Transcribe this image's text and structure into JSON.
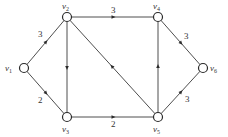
{
  "graph": {
    "type": "directed-weighted",
    "nodes": [
      {
        "id": "v1",
        "label": "v",
        "sub": "1",
        "x": 24,
        "y": 68,
        "lx": 5,
        "ly": 71
      },
      {
        "id": "v2",
        "label": "v",
        "sub": "2",
        "x": 67,
        "y": 17,
        "lx": 62,
        "ly": 9
      },
      {
        "id": "v3",
        "label": "v",
        "sub": "3",
        "x": 67,
        "y": 117,
        "lx": 62,
        "ly": 132
      },
      {
        "id": "v4",
        "label": "v",
        "sub": "4",
        "x": 158,
        "y": 17,
        "lx": 153,
        "ly": 9
      },
      {
        "id": "v5",
        "label": "v",
        "sub": "5",
        "x": 158,
        "y": 117,
        "lx": 153,
        "ly": 132
      },
      {
        "id": "v6",
        "label": "v",
        "sub": "6",
        "x": 203,
        "y": 68,
        "lx": 210,
        "ly": 71
      }
    ],
    "edges": [
      {
        "from": "v1",
        "to": "v2",
        "weight": "3",
        "wx": 38,
        "wy": 37
      },
      {
        "from": "v1",
        "to": "v3",
        "weight": "2",
        "wx": 38,
        "wy": 103
      },
      {
        "from": "v2",
        "to": "v4",
        "weight": "3",
        "wx": 111,
        "wy": 13
      },
      {
        "from": "v2",
        "to": "v3",
        "weight": "",
        "wx": 0,
        "wy": 0
      },
      {
        "from": "v5",
        "to": "v2",
        "weight": "",
        "wx": 0,
        "wy": 0
      },
      {
        "from": "v3",
        "to": "v5",
        "weight": "2",
        "wx": 111,
        "wy": 127
      },
      {
        "from": "v5",
        "to": "v4",
        "weight": "",
        "wx": 0,
        "wy": 0
      },
      {
        "from": "v4",
        "to": "v6",
        "weight": "3",
        "wx": 184,
        "wy": 39
      },
      {
        "from": "v5",
        "to": "v6",
        "weight": "3",
        "wx": 185,
        "wy": 102
      }
    ]
  }
}
